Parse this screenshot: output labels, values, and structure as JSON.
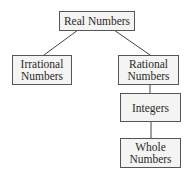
{
  "diagram": {
    "type": "hierarchy",
    "nodes": [
      {
        "id": "real",
        "label": "Real Numbers"
      },
      {
        "id": "irrational",
        "label": "Irrational Numbers",
        "line1": "Irrational",
        "line2": "Numbers"
      },
      {
        "id": "rational",
        "label": "Rational Numbers",
        "line1": "Rational",
        "line2": "Numbers"
      },
      {
        "id": "integers",
        "label": "Integers"
      },
      {
        "id": "whole",
        "label": "Whole Numbers",
        "line1": "Whole",
        "line2": "Numbers"
      }
    ],
    "edges": [
      [
        "real",
        "irrational"
      ],
      [
        "real",
        "rational"
      ],
      [
        "rational",
        "integers"
      ],
      [
        "integers",
        "whole"
      ]
    ]
  }
}
